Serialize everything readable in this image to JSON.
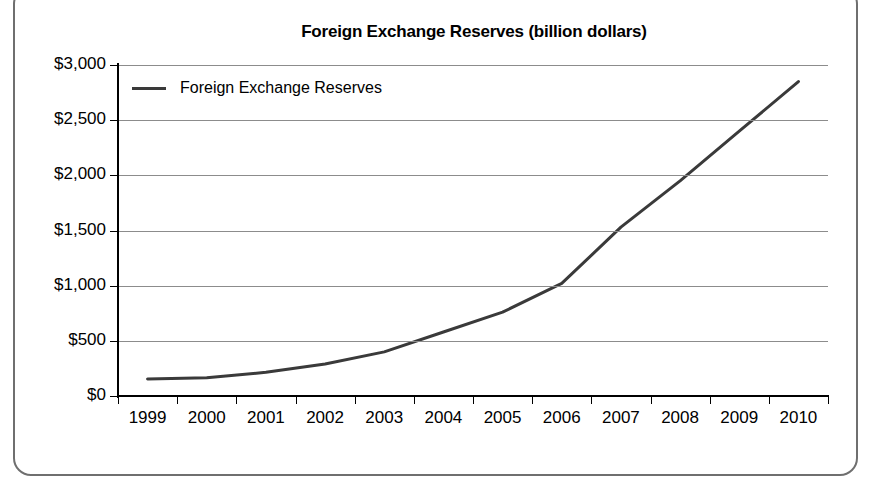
{
  "chart_data": {
    "type": "line",
    "title": "Foreign Exchange Reserves (billion dollars)",
    "xlabel": "",
    "ylabel": "",
    "categories": [
      "1999",
      "2000",
      "2001",
      "2002",
      "2003",
      "2004",
      "2005",
      "2006",
      "2007",
      "2008",
      "2009",
      "2010"
    ],
    "series": [
      {
        "name": "Foreign Exchange Reserves",
        "values": [
          155,
          165,
          215,
          290,
          400,
          580,
          760,
          1020,
          1530,
          1950,
          2400,
          2850
        ],
        "color": "#3a3a3a"
      }
    ],
    "ylim": [
      0,
      3000
    ],
    "yticks": [
      0,
      500,
      1000,
      1500,
      2000,
      2500,
      3000
    ],
    "ytick_labels": [
      "$0",
      "$500",
      "$1,000",
      "$1,500",
      "$2,000",
      "$2,500",
      "$3,000"
    ],
    "grid": true,
    "gridlines": "horizontal",
    "legend": {
      "position": "top-left-inside",
      "entries": [
        "Foreign Exchange Reserves"
      ]
    },
    "colors": {
      "line": "#3a3a3a",
      "grid": "#8c8c8c",
      "axis": "#000000",
      "frame": "#6f6f6f",
      "background": "#ffffff",
      "text": "#000000"
    }
  }
}
